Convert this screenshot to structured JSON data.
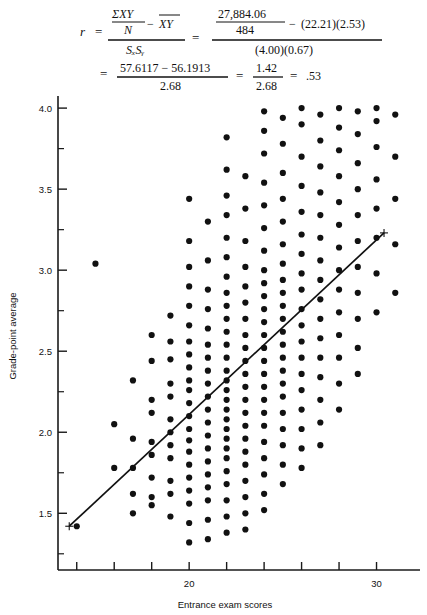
{
  "formula": {
    "line1": {
      "lhs": "r",
      "eq1": "=",
      "frac1_num_top": "ΣXY",
      "frac1_num_bot": "N",
      "frac1_minus": "−",
      "frac1_num_right": "XY",
      "frac1_den": "SₓSᵧ",
      "eq2": "=",
      "frac2_num_top": "27,884.06",
      "frac2_num_bot": "484",
      "frac2_minus": "−",
      "frac2_num_right": "(22.21)(2.53)",
      "frac2_den": "(4.00)(0.67)"
    },
    "line2": {
      "eq3": "=",
      "frac3_num": "57.6117 − 56.1913",
      "frac3_den": "2.68",
      "eq4": "=",
      "frac4_num": "1.42",
      "frac4_den": "2.68",
      "eq5": "=",
      "result": ".53"
    }
  },
  "chart_data": {
    "type": "scatter",
    "title": "",
    "xlabel": "Entrance exam scores",
    "ylabel": "Grade-point average",
    "xlim": [
      13,
      32
    ],
    "ylim": [
      1.15,
      4.05
    ],
    "x_ticks": [
      14,
      16,
      18,
      20,
      22,
      24,
      26,
      28,
      30
    ],
    "x_tick_labels": [
      "",
      "",
      "",
      "20",
      "",
      "",
      "",
      "",
      "30"
    ],
    "y_ticks": [
      1.25,
      1.5,
      1.75,
      2.0,
      2.25,
      2.5,
      2.75,
      3.0,
      3.25,
      3.5,
      3.75,
      4.0
    ],
    "y_tick_labels": [
      "",
      "1.5",
      "",
      "2.0",
      "",
      "2.5",
      "",
      "3.0",
      "",
      "3.5",
      "",
      "4.0"
    ],
    "grid": false,
    "legend": null,
    "regression_line": {
      "x0": 13.6,
      "y0": 1.42,
      "x1": 30.4,
      "y1": 3.23,
      "endpoint_marker": "plus"
    },
    "correlation_r": 0.53,
    "columns": [
      {
        "x": 14,
        "y": [
          1.42
        ]
      },
      {
        "x": 15,
        "y": [
          3.04
        ]
      },
      {
        "x": 16,
        "y": [
          2.05,
          1.78
        ]
      },
      {
        "x": 17,
        "y": [
          2.32,
          1.96,
          1.78,
          1.62,
          1.5
        ]
      },
      {
        "x": 18,
        "y": [
          2.6,
          2.44,
          2.2,
          2.12,
          1.94,
          1.86,
          1.72,
          1.6,
          1.55
        ]
      },
      {
        "x": 19,
        "y": [
          2.72,
          2.56,
          2.45,
          2.3,
          2.22,
          2.08,
          2.0,
          1.92,
          1.84,
          1.7,
          1.62,
          1.48
        ]
      },
      {
        "x": 20,
        "y": [
          3.44,
          3.18,
          3.02,
          2.9,
          2.78,
          2.66,
          2.56,
          2.48,
          2.4,
          2.32,
          2.26,
          2.18,
          2.1,
          2.02,
          1.95,
          1.88,
          1.8,
          1.72,
          1.64,
          1.56,
          1.44,
          1.32
        ]
      },
      {
        "x": 21,
        "y": [
          3.3,
          3.06,
          2.88,
          2.76,
          2.64,
          2.54,
          2.46,
          2.38,
          2.3,
          2.22,
          2.14,
          2.06,
          1.98,
          1.9,
          1.82,
          1.74,
          1.66,
          1.58,
          1.46,
          1.34
        ]
      },
      {
        "x": 22,
        "y": [
          3.82,
          3.62,
          3.46,
          3.34,
          3.2,
          3.08,
          2.96,
          2.86,
          2.78,
          2.7,
          2.62,
          2.54,
          2.46,
          2.38,
          2.32,
          2.26,
          2.2,
          2.14,
          2.08,
          2.02,
          1.96,
          1.9,
          1.84,
          1.76,
          1.68,
          1.58,
          1.48,
          1.38
        ]
      },
      {
        "x": 23,
        "y": [
          3.58,
          3.38,
          3.18,
          3.02,
          2.9,
          2.8,
          2.7,
          2.6,
          2.52,
          2.44,
          2.36,
          2.28,
          2.2,
          2.12,
          2.04,
          1.96,
          1.88,
          1.8,
          1.7,
          1.6,
          1.5,
          1.4
        ]
      },
      {
        "x": 24,
        "y": [
          3.98,
          3.86,
          3.72,
          3.54,
          3.4,
          3.26,
          3.12,
          3.0,
          2.92,
          2.84,
          2.76,
          2.68,
          2.6,
          2.52,
          2.44,
          2.36,
          2.28,
          2.2,
          2.12,
          2.04,
          1.94,
          1.84,
          1.74,
          1.62,
          1.52
        ]
      },
      {
        "x": 25,
        "y": [
          3.94,
          3.78,
          3.6,
          3.44,
          3.3,
          3.16,
          3.04,
          2.94,
          2.86,
          2.78,
          2.7,
          2.62,
          2.54,
          2.46,
          2.38,
          2.3,
          2.22,
          2.12,
          2.02,
          1.92,
          1.8,
          1.68
        ]
      },
      {
        "x": 26,
        "y": [
          4.0,
          3.9,
          3.7,
          3.52,
          3.36,
          3.22,
          3.1,
          2.98,
          2.88,
          2.76,
          2.66,
          2.56,
          2.46,
          2.36,
          2.26,
          2.14,
          2.02,
          1.9,
          1.78
        ]
      },
      {
        "x": 27,
        "y": [
          3.96,
          3.8,
          3.64,
          3.48,
          3.34,
          3.2,
          3.06,
          2.94,
          2.82,
          2.7,
          2.58,
          2.46,
          2.34,
          2.2,
          2.06,
          1.92
        ]
      },
      {
        "x": 28,
        "y": [
          4.0,
          3.88,
          3.74,
          3.58,
          3.42,
          3.28,
          3.14,
          3.0,
          2.88,
          2.74,
          2.6,
          2.46,
          2.3,
          2.14
        ]
      },
      {
        "x": 29,
        "y": [
          3.98,
          3.84,
          3.66,
          3.5,
          3.34,
          3.18,
          3.02,
          2.86,
          2.7,
          2.52,
          2.36
        ]
      },
      {
        "x": 30,
        "y": [
          4.0,
          3.92,
          3.76,
          3.56,
          3.38,
          3.2,
          2.98,
          2.74
        ]
      },
      {
        "x": 31,
        "y": [
          3.96,
          3.7,
          3.44,
          3.16,
          2.86
        ]
      }
    ]
  }
}
